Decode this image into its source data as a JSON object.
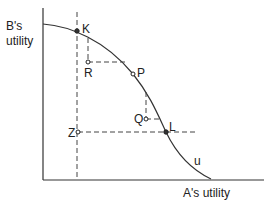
{
  "diagram": {
    "y_axis_label_line1": "B's",
    "y_axis_label_line2": "utility",
    "x_axis_label": "A's  utility",
    "curve_label": "u",
    "points": {
      "K": "K",
      "R": "R",
      "P": "P",
      "Q": "Q",
      "L": "L",
      "Z": "Z"
    }
  }
}
